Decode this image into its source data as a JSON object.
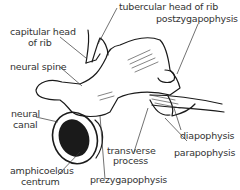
{
  "diagram": {
    "labels": {
      "tubercular_head": "tubercular head of rib",
      "capitular_head_1": "capitular head",
      "capitular_head_2": "of rib",
      "postzygapophysis": "postzygapophysis",
      "neural_spine": "neural spine",
      "neural_canal_1": "neural",
      "neural_canal_2": "canal",
      "diapophysis": "diapophysis",
      "transverse_1": "transverse",
      "transverse_2": "process",
      "parapophysis": "parapophysis",
      "amphicoelous_1": "amphicoelous",
      "amphicoelous_2": "centrum",
      "prezygapophysis": "prezygapophysis"
    },
    "colors": {
      "ink": "#222222",
      "background": "#ffffff"
    }
  }
}
